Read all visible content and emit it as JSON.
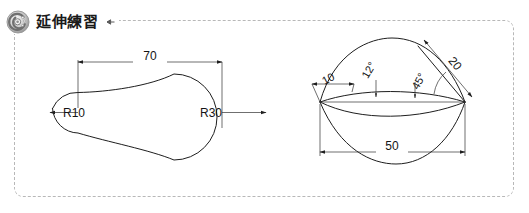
{
  "header": {
    "icon": "spiral-swirl-icon",
    "title": "延伸練習",
    "leader_arrow": "left-arrow-icon"
  },
  "figures": [
    {
      "id": "teardrop-figure",
      "name": "pear-profile-drawing",
      "dimensions": [
        {
          "id": "center-distance",
          "label": "70"
        },
        {
          "id": "small-radius",
          "label": "R10"
        },
        {
          "id": "large-radius",
          "label": "R30"
        }
      ]
    },
    {
      "id": "lens-figure",
      "name": "lens-profile-drawing",
      "dimensions": [
        {
          "id": "chord-short",
          "label": "10"
        },
        {
          "id": "angle-small",
          "label": "12°"
        },
        {
          "id": "angle-large",
          "label": "45°"
        },
        {
          "id": "slant-length",
          "label": "20"
        },
        {
          "id": "overall-width",
          "label": "50"
        }
      ]
    }
  ],
  "colors": {
    "line": "#1e1e1e",
    "frame": "#b8b8b8",
    "text": "#141414",
    "icon": "#8d8d8d"
  }
}
